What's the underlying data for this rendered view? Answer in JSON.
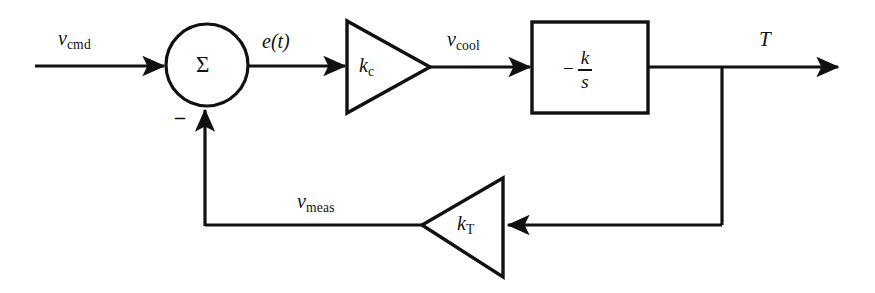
{
  "figure": {
    "type": "control-system-block-diagram",
    "background_color": "#ffffff",
    "line_color": "#111111"
  },
  "signals": {
    "command": {
      "base": "v",
      "subscript": "cmd",
      "full": "v_cmd"
    },
    "error": {
      "full": "e(t)"
    },
    "cooling": {
      "base": "v",
      "subscript": "cool",
      "full": "v_cool"
    },
    "measured": {
      "base": "v",
      "subscript": "meas",
      "full": "v_meas"
    },
    "output": {
      "full": "T"
    }
  },
  "blocks": {
    "summing_junction": {
      "symbol": "Σ",
      "feedback_sign": "–"
    },
    "controller_gain": {
      "base": "k",
      "subscript": "c",
      "full": "k_c"
    },
    "plant": {
      "sign": "−",
      "numerator": "k",
      "denominator": "s",
      "full": "-k/s"
    },
    "sensor_gain": {
      "base": "k",
      "subscript": "T",
      "full": "k_T"
    }
  }
}
